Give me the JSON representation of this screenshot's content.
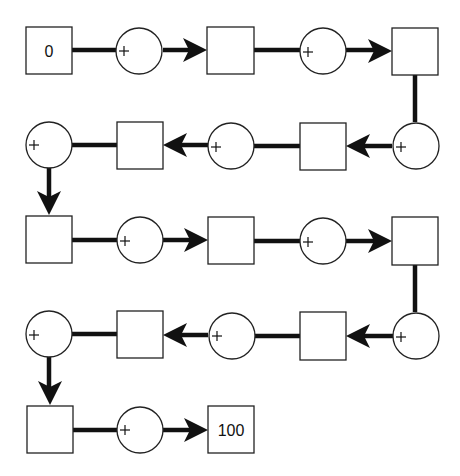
{
  "diagram": {
    "type": "addition-chain-puzzle",
    "start_value": "0",
    "end_value": "100",
    "operator_symbol": "+",
    "node_sequence": [
      {
        "kind": "box",
        "value": "0"
      },
      {
        "kind": "plus"
      },
      {
        "kind": "box",
        "value": ""
      },
      {
        "kind": "plus"
      },
      {
        "kind": "box",
        "value": ""
      },
      {
        "kind": "plus"
      },
      {
        "kind": "box",
        "value": ""
      },
      {
        "kind": "plus"
      },
      {
        "kind": "box",
        "value": ""
      },
      {
        "kind": "plus"
      },
      {
        "kind": "box",
        "value": ""
      },
      {
        "kind": "plus"
      },
      {
        "kind": "box",
        "value": ""
      },
      {
        "kind": "plus"
      },
      {
        "kind": "box",
        "value": ""
      },
      {
        "kind": "plus"
      },
      {
        "kind": "box",
        "value": ""
      },
      {
        "kind": "plus"
      },
      {
        "kind": "box",
        "value": ""
      },
      {
        "kind": "plus"
      },
      {
        "kind": "box",
        "value": "100"
      }
    ],
    "colors": {
      "stroke": "#222222",
      "arrow": "#111111",
      "background": "#ffffff"
    }
  }
}
